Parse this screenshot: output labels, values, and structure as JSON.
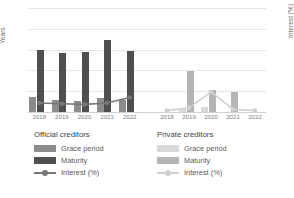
{
  "chart_data": {
    "type": "bar",
    "title": "",
    "subtitle": "",
    "xlabel": "",
    "ylabel": "Years",
    "y2label": "Interest (%)",
    "categories": [
      "2018",
      "2019",
      "2020",
      "2021",
      "2022"
    ],
    "ylim": [
      0,
      50
    ],
    "yticks": [
      0,
      10,
      20,
      30,
      40,
      50
    ],
    "y2lim": [
      0,
      15
    ],
    "y2ticks": [
      0,
      3,
      6,
      9,
      12,
      15
    ],
    "grid": true,
    "legend_position": "below",
    "panels": [
      {
        "name": "Official creditors",
        "series": [
          {
            "name": "Grace period",
            "axis": "left",
            "type": "bar",
            "color": "#8c8c8c",
            "values": [
              7.0,
              6.0,
              5.5,
              6.5,
              6.0
            ]
          },
          {
            "name": "Maturity",
            "axis": "left",
            "type": "bar",
            "color": "#4f4f4f",
            "values": [
              30.0,
              28.5,
              29.0,
              34.5,
              29.5
            ]
          },
          {
            "name": "Interest (%)",
            "axis": "right",
            "type": "line",
            "color": "#777777",
            "values": [
              1.3,
              1.2,
              1.1,
              1.3,
              2.1
            ]
          }
        ]
      },
      {
        "name": "Private creditors",
        "series": [
          {
            "name": "Grace period",
            "axis": "left",
            "type": "bar",
            "color": "#d8d8d8",
            "values": [
              0,
              1.8,
              2.2,
              0,
              0
            ]
          },
          {
            "name": "Maturity",
            "axis": "left",
            "type": "bar",
            "color": "#b5b5b5",
            "values": [
              0,
              19.5,
              10.8,
              9.8,
              0
            ]
          },
          {
            "name": "Interest (%)",
            "axis": "right",
            "type": "line",
            "color": "#d0d0d0",
            "values": [
              0.2,
              0.6,
              2.9,
              0.4,
              0.2
            ]
          }
        ]
      }
    ]
  },
  "legends": {
    "official": {
      "title": "Official creditors",
      "items": [
        {
          "label": "Grace period",
          "marker": "square",
          "color": "#8c8c8c"
        },
        {
          "label": "Maturity",
          "marker": "square",
          "color": "#4f4f4f"
        },
        {
          "label": "Interest (%)",
          "marker": "line-dot",
          "color": "#777777"
        }
      ]
    },
    "private": {
      "title": "Private creditors",
      "items": [
        {
          "label": "Grace period",
          "marker": "square",
          "color": "#d8d8d8"
        },
        {
          "label": "Maturity",
          "marker": "square",
          "color": "#b5b5b5"
        },
        {
          "label": "Interest (%)",
          "marker": "line-dot",
          "color": "#d0d0d0"
        }
      ]
    }
  }
}
